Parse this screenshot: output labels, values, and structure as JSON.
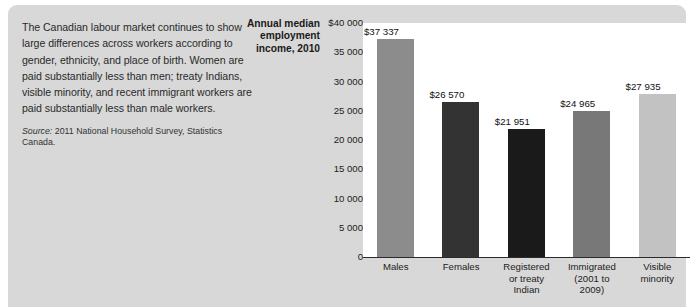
{
  "commentary": {
    "body": "The Canadian labour market continues to show large differences across workers according to gender, ethnicity, and place of birth. Women are paid substantially less than men; treaty Indians, visible minority, and recent immigrant workers are paid substantially less than male workers.",
    "source_label": "Source:",
    "source_text": " 2011 National Household Survey, Statistics Canada."
  },
  "axis_title": "Annual median employment income, 2010",
  "chart_data": {
    "type": "bar",
    "title": "Annual median employment income, 2010",
    "xlabel": "",
    "ylabel": "Annual median employment income, 2010",
    "categories": [
      "Males",
      "Females",
      "Registered or treaty Indian",
      "Immigrated (2001 to 2009)",
      "Visible minority"
    ],
    "category_lines": [
      [
        "Males"
      ],
      [
        "Females"
      ],
      [
        "Registered",
        "or treaty",
        "Indian"
      ],
      [
        "Immigrated",
        "(2001 to",
        "2009)"
      ],
      [
        "Visible",
        "minority"
      ]
    ],
    "values": [
      37337,
      26570,
      21951,
      24965,
      27935
    ],
    "value_labels": [
      "$37 337",
      "$26 570",
      "$21 951",
      "$24 965",
      "$27 935"
    ],
    "bar_colors": [
      "#8c8c8c",
      "#333333",
      "#1a1a1a",
      "#787878",
      "#c2c2c2"
    ],
    "ylim": [
      0,
      40000
    ],
    "ytick_values": [
      40000,
      35000,
      30000,
      25000,
      20000,
      15000,
      10000,
      5000,
      0
    ],
    "ytick_labels": [
      "$40 000",
      "35 000",
      "30 000",
      "25 000",
      "20 000",
      "15 000",
      "10 000",
      "5 000",
      "0"
    ],
    "grid": false,
    "legend": "none"
  },
  "colors": {
    "panel_background": "#d8d8d8",
    "plot_background": "#ffffff",
    "axis_line": "#2b2b2b",
    "text": "#1c1c1c"
  }
}
